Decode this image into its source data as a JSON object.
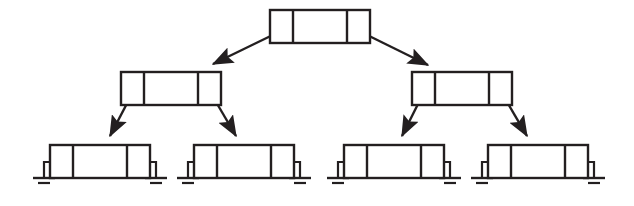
{
  "diagram": {
    "type": "node-link-diagram",
    "canvas": {
      "width": 634,
      "height": 206,
      "background": "#ffffff"
    },
    "style": {
      "stroke_color": "#231f20",
      "fill_color": "#ffffff",
      "node_stroke_width": 2.4,
      "link_stroke_width": 2.4,
      "ground_stroke_width": 2.2,
      "arrow_length": 11,
      "arrow_width": 7
    },
    "node_template": {
      "description": "Rectangle split into three fields: narrow left pointer field, wide middle data field, narrow right pointer field.",
      "fields": [
        "left-pointer",
        "data",
        "right-pointer"
      ],
      "width": 100,
      "height": 33,
      "left_cell_width": 23,
      "right_cell_width": 23
    },
    "levels": [
      {
        "name": "root",
        "depth": 0,
        "node_count": 1
      },
      {
        "name": "internal",
        "depth": 1,
        "node_count": 2
      },
      {
        "name": "leaves",
        "depth": 2,
        "node_count": 4
      }
    ],
    "nodes": [
      {
        "id": "root",
        "label": "root-node",
        "level": 0,
        "x": 270,
        "y": 10,
        "width": 100,
        "height": 33,
        "left_child": "n1",
        "right_child": "n2",
        "left_null": false,
        "right_null": false
      },
      {
        "id": "n1",
        "label": "internal-node-left",
        "level": 1,
        "x": 121,
        "y": 72,
        "width": 100,
        "height": 33,
        "left_child": "l1",
        "right_child": "l2",
        "left_null": false,
        "right_null": false
      },
      {
        "id": "n2",
        "label": "internal-node-right",
        "level": 1,
        "x": 412,
        "y": 72,
        "width": 100,
        "height": 33,
        "left_child": "l3",
        "right_child": "l4",
        "left_null": false,
        "right_null": false
      },
      {
        "id": "l1",
        "label": "leaf-node-1",
        "level": 2,
        "x": 50,
        "y": 145,
        "width": 100,
        "height": 33,
        "left_child": null,
        "right_child": null,
        "left_null": true,
        "right_null": true
      },
      {
        "id": "l2",
        "label": "leaf-node-2",
        "level": 2,
        "x": 194,
        "y": 145,
        "width": 100,
        "height": 33,
        "left_child": null,
        "right_child": null,
        "left_null": true,
        "right_null": true
      },
      {
        "id": "l3",
        "label": "leaf-node-3",
        "level": 2,
        "x": 344,
        "y": 145,
        "width": 100,
        "height": 33,
        "left_child": null,
        "right_child": null,
        "left_null": true,
        "right_null": true
      },
      {
        "id": "l4",
        "label": "leaf-node-4",
        "level": 2,
        "x": 488,
        "y": 145,
        "width": 100,
        "height": 33,
        "left_child": null,
        "right_child": null,
        "left_null": true,
        "right_null": true
      }
    ],
    "edges": [
      {
        "id": "e-root-left",
        "label": "root-to-left-child",
        "from": "root",
        "from_field": "left-pointer",
        "to": "n1",
        "x1": 283,
        "y1": 30,
        "x2": 211,
        "y2": 65
      },
      {
        "id": "e-root-right",
        "label": "root-to-right-child",
        "from": "root",
        "from_field": "right-pointer",
        "to": "n2",
        "x1": 357,
        "y1": 30,
        "x2": 430,
        "y2": 66
      },
      {
        "id": "e-n1-left",
        "label": "left-internal-to-leaf-1",
        "from": "n1",
        "from_field": "left-pointer",
        "to": "l1",
        "x1": 134,
        "y1": 90,
        "x2": 108,
        "y2": 137
      },
      {
        "id": "e-n1-right",
        "label": "left-internal-to-leaf-2",
        "from": "n1",
        "from_field": "right-pointer",
        "to": "l2",
        "x1": 209,
        "y1": 90,
        "x2": 238,
        "y2": 137
      },
      {
        "id": "e-n2-left",
        "label": "right-internal-to-leaf-3",
        "from": "n2",
        "from_field": "left-pointer",
        "to": "l3",
        "x1": 425,
        "y1": 90,
        "x2": 400,
        "y2": 137
      },
      {
        "id": "e-n2-right",
        "label": "right-internal-to-leaf-4",
        "from": "n2",
        "from_field": "right-pointer",
        "to": "l4",
        "x1": 500,
        "y1": 90,
        "x2": 529,
        "y2": 137
      }
    ],
    "null_markers": {
      "symbol": "ground",
      "description": "Electrical-ground glyph used to denote a null pointer: a lead from the pointer field out and down to a wide bar with a shorter bar beneath.",
      "bar_long": 22,
      "bar_short": 12,
      "bar_gap": 5,
      "count": 8
    }
  }
}
